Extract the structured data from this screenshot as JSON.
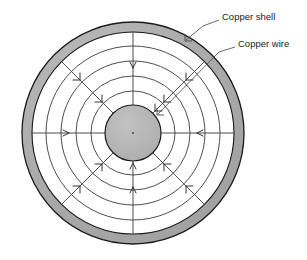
{
  "figure": {
    "background_color": "#ffffff"
  },
  "labels": [
    {
      "id": "copper-shell",
      "text": "Copper shell",
      "text_x": 222,
      "text_y": 17,
      "leader": "M 219 20 L 203 26 L 186 40",
      "arrow_tip_x": 185,
      "arrow_tip_y": 41,
      "arrow_angle": 140
    },
    {
      "id": "copper-wire",
      "text": "Copper wire",
      "text_x": 238,
      "text_y": 44,
      "leader": "M 235 47 L 219 52 L 158 114",
      "arrow_tip_x": 157,
      "arrow_tip_y": 115,
      "arrow_angle": 135
    }
  ],
  "geometry": {
    "center_x": 133,
    "center_y": 133,
    "shell_outer_radius": 111,
    "shell_inner_radius": 101,
    "wire_radius": 28,
    "field_circle_radii": [
      42,
      57,
      72,
      87
    ],
    "spoke_count": 8,
    "spoke_angles_deg": [
      0,
      45,
      90,
      135,
      180,
      225,
      270,
      315
    ],
    "center_dot_radius": 1.1,
    "field_direction": "inward"
  },
  "colors": {
    "shell_fill": "#a9a9a9",
    "wire_fill": "#b3b3b3",
    "outline": "#1a1a1a",
    "field_line": "#333333",
    "label_text": "#1a1a1a",
    "leader_line": "#444444",
    "background": "#ffffff"
  },
  "arrow_markers": {
    "spoke_arrow_radii": [
      96,
      80,
      64,
      49
    ],
    "note": "arrowheads on radial spokes point toward the center"
  }
}
